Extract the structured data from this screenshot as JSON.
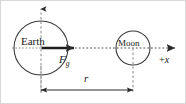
{
  "diagram": {
    "bodies": [
      {
        "name": "Earth",
        "label": "Earth",
        "center_x": 41,
        "center_y": 48,
        "radius": 27
      },
      {
        "name": "Moon",
        "label": "Moon",
        "center_x": 133,
        "center_y": 48,
        "radius": 17
      }
    ],
    "vectors": [
      {
        "name": "gravitational-force",
        "symbol": "F",
        "subscript": "g",
        "from_x": 41,
        "from_y": 48,
        "to_x": 75,
        "to_y": 48,
        "direction": "+x"
      }
    ],
    "axes": [
      {
        "name": "x-axis",
        "label": "+x",
        "label_symbol": "x",
        "label_sign": "+",
        "orientation": "horizontal",
        "style": "dotted",
        "from_x": 12,
        "to_x": 178,
        "y": 48
      },
      {
        "name": "y-axis",
        "label": "",
        "orientation": "vertical",
        "style": "dashed",
        "x": 41,
        "from_y": 92,
        "to_y": 8
      }
    ],
    "dimension": {
      "name": "separation-distance",
      "label": "r",
      "from_x": 41,
      "to_x": 133,
      "y": 90,
      "extension_top_y": 48,
      "arrow_style": "double-headed"
    },
    "colors": {
      "stroke": "#2b2b2b",
      "dashed_guide": "#9a9a9a",
      "dotted_axis": "#8a8a8a",
      "text": "#1a1a1a",
      "background": "#ffffff",
      "border": "#cfcfcf"
    }
  }
}
